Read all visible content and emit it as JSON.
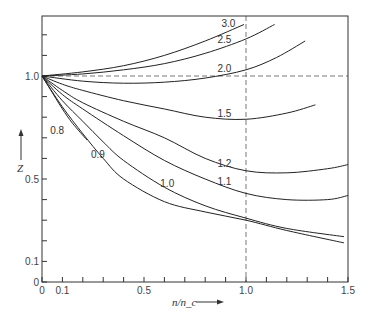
{
  "chart_data": {
    "type": "line",
    "title": "",
    "xlabel": "n/n_c",
    "ylabel": "Z",
    "xlim": [
      0,
      1.5
    ],
    "ylim": [
      0,
      1.29
    ],
    "grid": false,
    "x_ticks": [
      {
        "v": 0,
        "label": "0"
      },
      {
        "v": 0.1,
        "label": "0.1"
      },
      {
        "v": 0.2,
        "label": ""
      },
      {
        "v": 0.3,
        "label": ""
      },
      {
        "v": 0.4,
        "label": ""
      },
      {
        "v": 0.5,
        "label": "0.5"
      },
      {
        "v": 0.6,
        "label": ""
      },
      {
        "v": 0.7,
        "label": ""
      },
      {
        "v": 0.8,
        "label": ""
      },
      {
        "v": 0.9,
        "label": ""
      },
      {
        "v": 1.0,
        "label": "1.0"
      },
      {
        "v": 1.1,
        "label": ""
      },
      {
        "v": 1.2,
        "label": ""
      },
      {
        "v": 1.3,
        "label": ""
      },
      {
        "v": 1.4,
        "label": ""
      },
      {
        "v": 1.5,
        "label": "1.5"
      }
    ],
    "y_ticks": [
      {
        "v": 0,
        "label": "0"
      },
      {
        "v": 0.1,
        "label": "0.1"
      },
      {
        "v": 0.2,
        "label": ""
      },
      {
        "v": 0.3,
        "label": ""
      },
      {
        "v": 0.4,
        "label": ""
      },
      {
        "v": 0.5,
        "label": "0.5"
      },
      {
        "v": 0.6,
        "label": ""
      },
      {
        "v": 0.7,
        "label": ""
      },
      {
        "v": 0.8,
        "label": ""
      },
      {
        "v": 0.9,
        "label": ""
      },
      {
        "v": 1.0,
        "label": "1.0"
      },
      {
        "v": 1.1,
        "label": ""
      },
      {
        "v": 1.2,
        "label": ""
      }
    ],
    "reference_lines": [
      {
        "orientation": "horizontal",
        "value": 1.0,
        "style": "dashed"
      },
      {
        "orientation": "vertical",
        "value": 1.0,
        "style": "dashed"
      }
    ],
    "series": [
      {
        "name": "3.0",
        "label_pos": [
          0.88,
          1.24
        ],
        "x": [
          0,
          0.2,
          0.4,
          0.6,
          0.8,
          0.99
        ],
        "y": [
          1.0,
          1.02,
          1.05,
          1.1,
          1.17,
          1.25
        ]
      },
      {
        "name": "2.5",
        "label_pos": [
          0.86,
          1.16
        ],
        "x": [
          0,
          0.2,
          0.4,
          0.6,
          0.8,
          1.0,
          1.14
        ],
        "y": [
          1.0,
          1.01,
          1.03,
          1.06,
          1.11,
          1.18,
          1.25
        ]
      },
      {
        "name": "2.0",
        "label_pos": [
          0.86,
          1.02
        ],
        "x": [
          0,
          0.2,
          0.4,
          0.6,
          0.8,
          1.0,
          1.15,
          1.29
        ],
        "y": [
          1.0,
          0.975,
          0.965,
          0.97,
          0.99,
          1.03,
          1.09,
          1.17
        ]
      },
      {
        "name": "1.5",
        "label_pos": [
          0.86,
          0.8
        ],
        "x": [
          0,
          0.1,
          0.2,
          0.4,
          0.6,
          0.8,
          1.0,
          1.2,
          1.34
        ],
        "y": [
          1.0,
          0.96,
          0.93,
          0.88,
          0.84,
          0.8,
          0.79,
          0.82,
          0.86
        ]
      },
      {
        "name": "1.2",
        "label_pos": [
          0.86,
          0.56
        ],
        "x": [
          0,
          0.1,
          0.2,
          0.4,
          0.6,
          0.8,
          1.0,
          1.2,
          1.4,
          1.5
        ],
        "y": [
          1.0,
          0.93,
          0.87,
          0.78,
          0.7,
          0.6,
          0.54,
          0.53,
          0.55,
          0.57
        ]
      },
      {
        "name": "1.1",
        "label_pos": [
          0.86,
          0.47
        ],
        "x": [
          0,
          0.1,
          0.2,
          0.4,
          0.6,
          0.8,
          1.0,
          1.2,
          1.4,
          1.5
        ],
        "y": [
          1.0,
          0.91,
          0.84,
          0.71,
          0.59,
          0.5,
          0.43,
          0.4,
          0.4,
          0.42
        ]
      },
      {
        "name": "1.0",
        "label_pos": [
          0.58,
          0.46
        ],
        "x": [
          0,
          0.1,
          0.2,
          0.3,
          0.4,
          0.6,
          0.8,
          1.0,
          1.2,
          1.48
        ],
        "y": [
          1.0,
          0.88,
          0.78,
          0.68,
          0.59,
          0.46,
          0.37,
          0.31,
          0.26,
          0.22
        ]
      },
      {
        "name": "0.9",
        "label_pos": [
          0.24,
          0.6
        ],
        "x": [
          0,
          0.1,
          0.2,
          0.3,
          0.4,
          0.6,
          0.8,
          1.0,
          1.2,
          1.48
        ],
        "y": [
          1.0,
          0.85,
          0.72,
          0.6,
          0.5,
          0.39,
          0.34,
          0.3,
          0.25,
          0.19
        ]
      },
      {
        "name": "0.8",
        "label_pos": [
          0.04,
          0.72
        ],
        "x": [
          0,
          0.05,
          0.1,
          0.15,
          0.22
        ],
        "y": [
          1.0,
          0.92,
          0.84,
          0.77,
          0.69
        ]
      }
    ],
    "annotations": [
      "x-axis arrow pointing right",
      "Z-axis arrow pointing up"
    ]
  }
}
